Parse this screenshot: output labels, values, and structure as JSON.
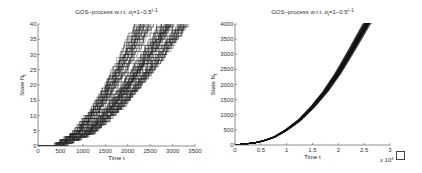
{
  "chart_data": [
    {
      "type": "line",
      "title": "GOS–process w.r.t. α_i=1−0.5^(i−1)",
      "title_main": "GOS–process w.r.t. α",
      "title_sub": "i",
      "title_rest": "=1−0.5",
      "title_sup": "i−1",
      "xlabel": "Time t",
      "ylabel": "State N",
      "ylabel_sub": "t",
      "xlim": [
        0,
        3500
      ],
      "ylim": [
        0,
        40
      ],
      "xticks": [
        0,
        500,
        1000,
        1500,
        2000,
        2500,
        3000,
        3500
      ],
      "yticks": [
        0,
        5,
        10,
        15,
        20,
        25,
        30,
        35,
        40
      ],
      "grid": false,
      "series_description": "~100 stochastic step paths; state rises from 0 to 40 between t≈0 and t≈3200, median path reaching 40 at t≈2600",
      "median_path": {
        "x": [
          0,
          500,
          1000,
          1500,
          2000,
          2500,
          2650
        ],
        "y": [
          0,
          1,
          5,
          13,
          24,
          36,
          40
        ]
      },
      "spread": 400
    },
    {
      "type": "line",
      "title": "GOS–process w.r.t. α_i=1−0.5^(i−1)",
      "title_main": "GOS–process w.r.t. α",
      "title_sub": "i",
      "title_rest": "=1−0.5",
      "title_sup": "i−1",
      "xlabel": "Time t",
      "ylabel": "State N",
      "ylabel_sub": "t",
      "xlim": [
        0,
        3
      ],
      "x_multiplier": "x 10",
      "x_multiplier_exp": "4",
      "ylim": [
        0,
        4000
      ],
      "xticks": [
        0,
        0.5,
        1,
        1.5,
        2,
        2.5,
        3
      ],
      "xtick_labels": [
        "0",
        "0.5",
        "1",
        "1.5",
        "2",
        "2.5",
        "3"
      ],
      "yticks": [
        0,
        500,
        1000,
        1500,
        2000,
        2500,
        3000,
        3500,
        4000
      ],
      "grid": false,
      "series_description": "dense bundle of paths following quadratic-like growth, reaching 4000 at t≈2.55e4",
      "median_path": {
        "x": [
          0,
          0.25,
          0.5,
          0.75,
          1,
          1.25,
          1.5,
          1.75,
          2,
          2.25,
          2.55
        ],
        "y": [
          0,
          25,
          110,
          250,
          500,
          820,
          1250,
          1760,
          2380,
          3100,
          4000
        ]
      }
    }
  ],
  "checkbox": {
    "checked": false
  }
}
